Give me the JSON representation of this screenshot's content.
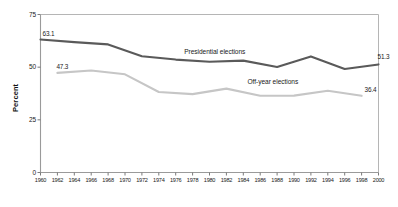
{
  "chart_data": {
    "type": "line",
    "title": "",
    "xlabel": "",
    "ylabel": "Percent",
    "ylim": [
      0,
      75
    ],
    "xlim": [
      1960,
      2000
    ],
    "yticks": [
      "0",
      "25",
      "50",
      "75"
    ],
    "ytick_values": [
      0,
      25,
      50,
      75
    ],
    "xticks": [
      "1960",
      "1962",
      "1964",
      "1966",
      "1968",
      "1970",
      "1972",
      "1974",
      "1976",
      "1978",
      "1980",
      "1982",
      "1984",
      "1986",
      "1988",
      "1990",
      "1992",
      "1994",
      "1996",
      "1998",
      "2000"
    ],
    "grid": false,
    "legend": "inline-annotations",
    "series": [
      {
        "name": "Presidential elections",
        "color": "#5a5a5a",
        "x": [
          1960,
          1964,
          1968,
          1972,
          1976,
          1980,
          1984,
          1988,
          1992,
          1996,
          2000
        ],
        "values": [
          63.1,
          61.9,
          60.8,
          55.2,
          53.6,
          52.6,
          53.1,
          50.1,
          55.1,
          49.1,
          51.3
        ],
        "start_label": "63.1",
        "end_label": "51.3"
      },
      {
        "name": "Off-year elections",
        "color": "#c6c6c6",
        "x": [
          1962,
          1966,
          1970,
          1974,
          1978,
          1982,
          1986,
          1990,
          1994,
          1998
        ],
        "values": [
          47.3,
          48.4,
          46.6,
          38.2,
          37.2,
          39.8,
          36.4,
          36.5,
          38.8,
          36.4
        ],
        "start_label": "47.3",
        "end_label": "36.4"
      }
    ],
    "annotations": [
      {
        "text": "Presidential elections",
        "series": "Presidential elections"
      },
      {
        "text": "Off-year elections",
        "series": "Off-year elections"
      }
    ]
  },
  "axis": {
    "y_title": "Percent"
  }
}
